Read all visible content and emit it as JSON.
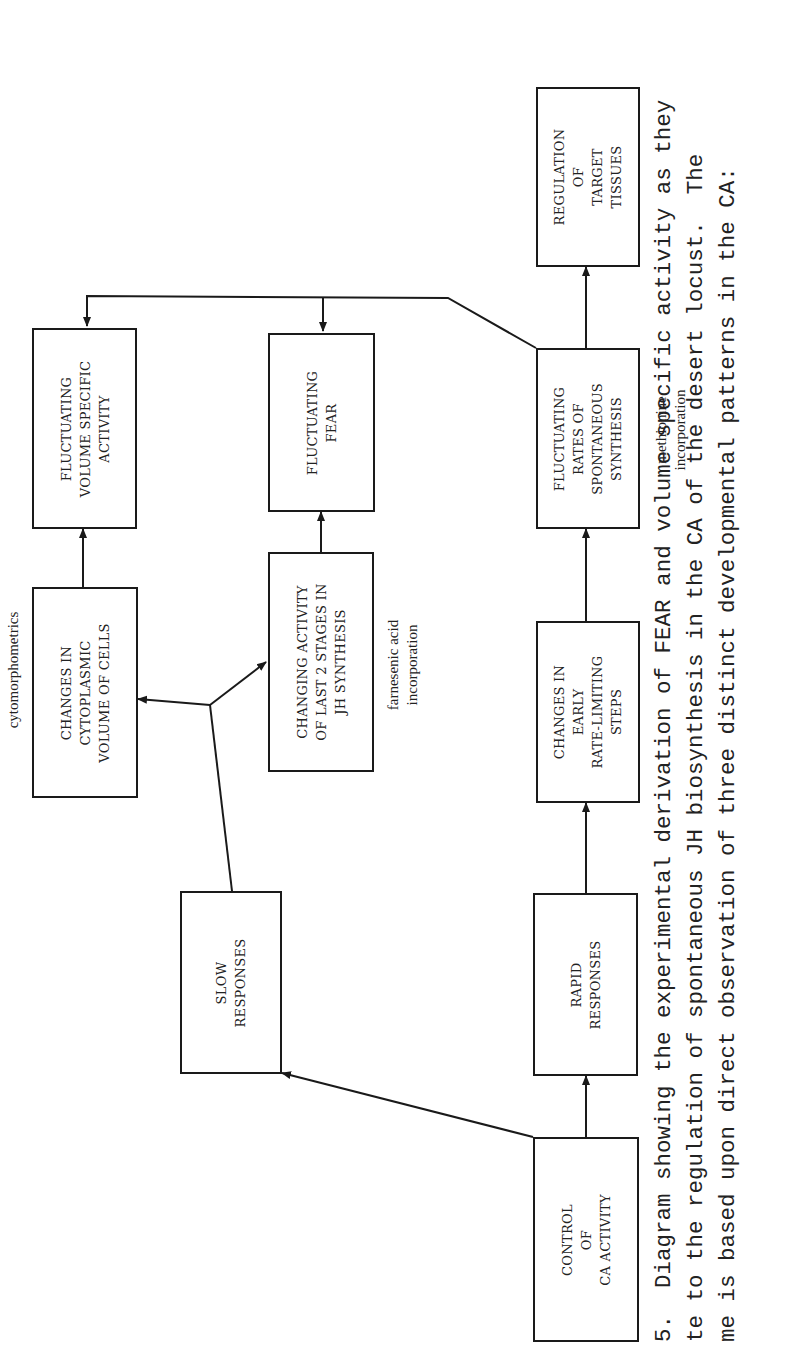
{
  "figure": {
    "orientation": "rotated 90 degrees counter-clockwise",
    "nodes": {
      "control": "CONTROL\nOF\nCA ACTIVITY",
      "slow": "SLOW\nRESPONSES",
      "rapid": "RAPID\nRESPONSES",
      "cytoplasmic": "CHANGES IN\nCYTOPLASMIC\nVOLUME OF CELLS",
      "last_stages": "CHANGING ACTIVITY\nOF LAST 2 STAGES IN\nJH SYNTHESIS",
      "early_steps": "CHANGES IN\nEARLY\nRATE-LIMITING\nSTEPS",
      "volume_specific": "FLUCTUATING\nVOLUME SPECIFIC\nACTIVITY",
      "fear": "FLUCTUATING\nFEAR",
      "spontaneous": "FLUCTUATING\nRATES OF\nSPONTANEOUS\nSYNTHESIS",
      "target": "REGULATION\nOF\nTARGET\nTISSUES"
    },
    "annotations": {
      "cytomorphometrics": "cytomorphometrics",
      "farnesenic": "farnesenic acid\nincorporation",
      "methionine": "methionine\nincorporation"
    },
    "edges": [
      {
        "from": "control",
        "to": "slow"
      },
      {
        "from": "control",
        "to": "rapid"
      },
      {
        "from": "slow",
        "to": "cytoplasmic / last_stages (bidirectional)"
      },
      {
        "from": "rapid",
        "to": "early_steps"
      },
      {
        "from": "cytoplasmic",
        "to": "volume_specific"
      },
      {
        "from": "last_stages",
        "to": "fear"
      },
      {
        "from": "early_steps",
        "to": "spontaneous"
      },
      {
        "from": "spontaneous",
        "to": "target"
      },
      {
        "from": "spontaneous",
        "to": "fear"
      },
      {
        "from": "spontaneous",
        "to": "volume_specific"
      }
    ],
    "caption": "5.  Diagram showing the experimental derivation of FEAR and volume specific activity as they\nte to the regulation of spontaneous JH biosynthesis in the CA of the desert locust.  The\nme is based upon direct observation of three distinct developmental patterns in the CA:"
  }
}
